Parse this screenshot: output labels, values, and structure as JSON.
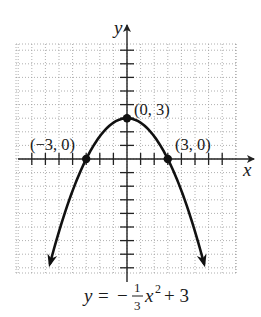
{
  "chart_data": {
    "type": "line",
    "title": "",
    "function": "y = -(1/3)x^2 + 3",
    "equation_label": {
      "y": "y",
      "equals": "=",
      "minus": "−",
      "frac_num": "1",
      "frac_den": "3",
      "x": "x",
      "exp": "2",
      "plus_const": "+ 3"
    },
    "xlabel": "x",
    "ylabel": "y",
    "xlim": [
      -8,
      8
    ],
    "ylim": [
      -8.5,
      8.5
    ],
    "grid": true,
    "grid_style": "dotted",
    "tick_spacing": 1,
    "tick_labels_shown": false,
    "labeled_points": [
      {
        "x": -3,
        "y": 0,
        "label": "(−3, 0)"
      },
      {
        "x": 0,
        "y": 3,
        "label": "(0, 3)"
      },
      {
        "x": 3,
        "y": 0,
        "label": "(3, 0)"
      }
    ],
    "curve_samples": {
      "x": [
        -5.66,
        -5,
        -4,
        -3,
        -2,
        -1,
        0,
        1,
        2,
        3,
        4,
        5,
        5.66
      ],
      "y": [
        -7.68,
        -5.33,
        -2.33,
        0,
        1.67,
        2.67,
        3,
        2.67,
        1.67,
        0,
        -2.33,
        -5.33,
        -7.68
      ]
    },
    "curve_arrows": "both ends pointing downward",
    "colors": {
      "curve": "#111111",
      "axes": "#222222",
      "grid": "#9a9a9a"
    }
  }
}
